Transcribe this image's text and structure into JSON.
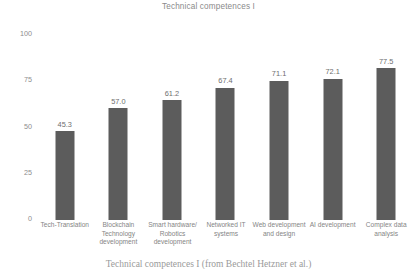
{
  "chart_data": {
    "type": "bar",
    "title": "Technical competences I",
    "xlabel": "",
    "ylabel": "",
    "ylim": [
      0,
      100
    ],
    "yticks": [
      100,
      75,
      50,
      25,
      0
    ],
    "grid": false,
    "legend": null,
    "bar_color": "#5c5c5c",
    "categories": [
      "Tech-Translation",
      "Blockchain Technology development",
      "Smart hardware/ Robotics development",
      "Networked IT systems",
      "Web development and design",
      "AI development",
      "Complex data analysis"
    ],
    "values": [
      45.3,
      57.0,
      61.2,
      67.4,
      71.1,
      72.1,
      77.5
    ],
    "value_labels": [
      "45.3",
      "57.0",
      "61.2",
      "67.4",
      "71.1",
      "72.1",
      "77.5"
    ],
    "tick_labels": [
      "100",
      "75",
      "50",
      "25",
      "0"
    ]
  },
  "caption": "Technical competences I (from Bechtel Hetzner et al.)"
}
